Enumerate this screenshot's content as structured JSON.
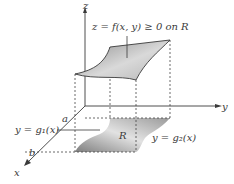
{
  "diagram": {
    "axes": {
      "x_label": "x",
      "y_label": "y",
      "z_label": "z"
    },
    "surface_label": "z = f(x, y) ≥ 0 on R",
    "region_label": "R",
    "lower_curve_label": "y = g₁(x)",
    "upper_curve_label": "y = g₂(x)",
    "bound_a": "a",
    "bound_b": "b",
    "colors": {
      "axis": "#3a3a3a",
      "surface_fill_light": "#d8d8d8",
      "surface_fill_dark": "#8f8f8f",
      "dashed": "#444444"
    }
  }
}
